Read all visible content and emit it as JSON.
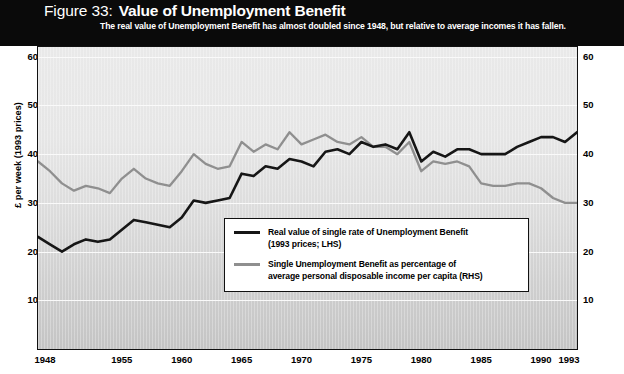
{
  "figure": {
    "number_label": "Figure 33:",
    "title": "Value of Unemployment Benefit",
    "subtitle": "The real value of Unemployment Benefit has almost doubled since 1948, but relative to average incomes it has fallen."
  },
  "axes": {
    "left_title": "£ per week (1993 prices)",
    "right_title": "Percentage of average personal disposable income per capita",
    "y_ticks": [
      "10",
      "20",
      "30",
      "40",
      "50",
      "60"
    ],
    "x_ticks": [
      "1948",
      "1955",
      "1960",
      "1965",
      "1970",
      "1975",
      "1980",
      "1985",
      "1990",
      "1993"
    ]
  },
  "legend": {
    "items": [
      {
        "swatch": "dark",
        "line1": "Real value of single rate of Unemployment Benefit",
        "line2": "(1993 prices; LHS)"
      },
      {
        "swatch": "light",
        "line1": "Single Unemployment Benefit as percentage of",
        "line2": "average personal disposable income per capita (RHS)"
      }
    ]
  },
  "colors": {
    "series_dark": "#161616",
    "series_light": "#8f8f8f",
    "banner": "#0a0a0a",
    "plot_border": "#111111",
    "gridline": "#fafafa"
  },
  "chart_data": {
    "type": "line",
    "title": "Value of Unemployment Benefit",
    "subtitle": "The real value of Unemployment Benefit has almost doubled since 1948, but relative to average incomes it has fallen.",
    "xlabel": "",
    "ylabel": "£ per week (1993 prices)",
    "y2label": "Percentage of average personal disposable income per capita",
    "xlim": [
      1948,
      1993
    ],
    "ylim": [
      0,
      62
    ],
    "y2lim": [
      0,
      62
    ],
    "yticks": [
      10,
      20,
      30,
      40,
      50,
      60
    ],
    "xticks": [
      1948,
      1955,
      1960,
      1965,
      1970,
      1975,
      1980,
      1985,
      1990,
      1993
    ],
    "grid": "horizontal",
    "legend_position": "inside-bottom-center",
    "x": [
      1948,
      1949,
      1950,
      1951,
      1952,
      1953,
      1954,
      1955,
      1956,
      1957,
      1958,
      1959,
      1960,
      1961,
      1962,
      1963,
      1964,
      1965,
      1966,
      1967,
      1968,
      1969,
      1970,
      1971,
      1972,
      1973,
      1974,
      1975,
      1976,
      1977,
      1978,
      1979,
      1980,
      1981,
      1982,
      1983,
      1984,
      1985,
      1986,
      1987,
      1988,
      1989,
      1990,
      1991,
      1992,
      1993
    ],
    "series": [
      {
        "name": "Real value of single rate of Unemployment Benefit (1993 prices; LHS)",
        "color": "#161616",
        "axis": "left",
        "units": "£ per week (1993 prices)",
        "values": [
          23.0,
          21.5,
          20.0,
          21.5,
          22.5,
          22.0,
          22.5,
          24.5,
          26.5,
          26.0,
          25.5,
          25.0,
          27.0,
          30.5,
          30.0,
          30.5,
          31.0,
          36.0,
          35.5,
          37.5,
          37.0,
          39.0,
          38.5,
          37.5,
          40.5,
          41.0,
          40.0,
          42.5,
          41.5,
          42.0,
          41.0,
          44.5,
          38.5,
          40.5,
          39.5,
          41.0,
          41.0,
          40.0,
          40.0,
          40.0,
          41.5,
          42.5,
          43.5,
          43.5,
          42.5,
          44.5
        ]
      },
      {
        "name": "Single Unemployment Benefit as percentage of average personal disposable income per capita (RHS)",
        "color": "#8f8f8f",
        "axis": "right",
        "units": "percent",
        "values": [
          38.5,
          36.5,
          34.0,
          32.5,
          33.5,
          33.0,
          32.0,
          35.0,
          37.0,
          35.0,
          34.0,
          33.5,
          36.5,
          40.0,
          38.0,
          37.0,
          37.5,
          42.5,
          40.5,
          42.0,
          41.0,
          44.5,
          42.0,
          43.0,
          44.0,
          42.5,
          42.0,
          43.5,
          41.5,
          41.5,
          40.0,
          42.5,
          36.5,
          38.5,
          38.0,
          38.5,
          37.5,
          34.0,
          33.5,
          33.5,
          34.0,
          34.0,
          33.0,
          31.0,
          30.0,
          30.0
        ]
      }
    ]
  }
}
